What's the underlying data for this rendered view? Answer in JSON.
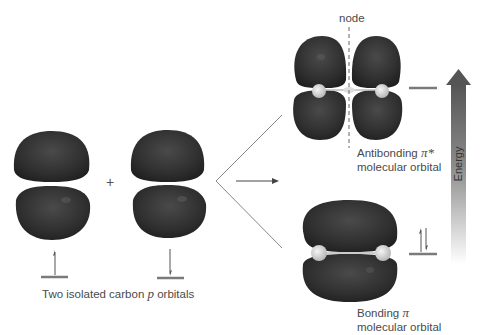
{
  "diagram": {
    "isolated_orbitals": {
      "caption_prefix": "Two isolated carbon ",
      "caption_italic": "p",
      "caption_suffix": " orbitals",
      "plus_sign": "+",
      "left_orbital_electron": "spin-up",
      "right_orbital_electron": "spin-down"
    },
    "antibonding": {
      "node_label": "node",
      "line1_prefix": "Antibonding ",
      "line1_symbol": "π*",
      "line2": "molecular orbital",
      "electrons": 0
    },
    "bonding": {
      "line1_prefix": "Bonding ",
      "line1_symbol": "π",
      "line2": "molecular orbital",
      "electrons": 2
    },
    "energy_axis": {
      "label": "Energy",
      "direction": "up"
    },
    "colors": {
      "lobe": "#2e2e2e",
      "lobe_highlight": "#5a5a5a",
      "nucleus": "#d8d8d8",
      "level_line": "#7a7a7a",
      "arrow_dark": "#555555",
      "arrow_light": "#ffffff",
      "text": "#4a4a4a"
    }
  }
}
